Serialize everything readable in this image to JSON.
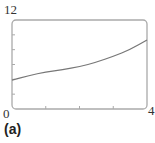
{
  "chart_data": {
    "type": "line",
    "title": "",
    "caption": "(a)",
    "xlabel": "",
    "ylabel": "",
    "xlim": [
      0,
      4
    ],
    "ylim": [
      0,
      12
    ],
    "x_tick_labels": [
      "0",
      "4"
    ],
    "y_tick_labels": [
      "12"
    ],
    "x_minor_ticks": [
      1,
      2,
      3
    ],
    "y_minor_ticks": [
      2,
      4,
      6,
      8,
      10
    ],
    "grid": false,
    "series": [
      {
        "name": "curve",
        "x": [
          0,
          0.5,
          1,
          1.5,
          2,
          2.5,
          3,
          3.5,
          4
        ],
        "y": [
          3.9,
          4.5,
          5.0,
          5.3,
          5.7,
          6.3,
          7.1,
          8.0,
          9.3
        ]
      }
    ]
  },
  "labels": {
    "y_max": "12",
    "x_min": "0",
    "x_max": "4",
    "caption": "(a)"
  },
  "colors": {
    "frame": "#aaaaaa",
    "curve": "#777777"
  }
}
